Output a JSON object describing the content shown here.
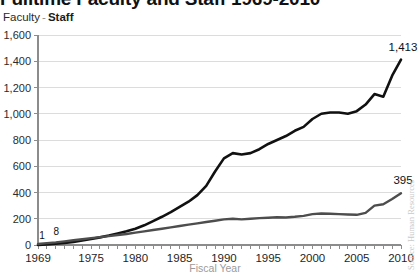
{
  "chart_title": "Fulltime Faculty and Staff   1969-2010",
  "legend": {
    "series_a": "Faculty",
    "separator": "-",
    "series_b": "Staff"
  },
  "axis_title_x": "Fiscal Year",
  "source_note": "Source: Human Resources",
  "colors": {
    "faculty_line": "#111111",
    "staff_line": "#4d4d4d",
    "gridline": "#dcdcdc",
    "axis": "#8c8c8c",
    "axis_label": "#1f1f1f",
    "axis_title": "#9b9b9b",
    "background": "#ffffff"
  },
  "annotations": {
    "start_faculty": "1",
    "start_staff": "8",
    "end_faculty": "1,413",
    "end_staff": "395"
  },
  "chart_data": {
    "type": "line",
    "title": "Fulltime Faculty and Staff   1969-2010",
    "xlabel": "Fiscal Year",
    "ylabel": "",
    "xlim": [
      1969,
      2010
    ],
    "ylim": [
      0,
      1600
    ],
    "grid": true,
    "legend_position": "top-left",
    "yticks": [
      0,
      200,
      400,
      600,
      800,
      1000,
      1200,
      1400,
      1600
    ],
    "ytick_labels": [
      "0",
      "200",
      "400",
      "600",
      "800",
      "1,000",
      "1,200",
      "1,400",
      "1,600"
    ],
    "xticks": [
      1969,
      1975,
      1980,
      1985,
      1990,
      1995,
      2000,
      2005,
      2010
    ],
    "xtick_labels": [
      "1969",
      "1975",
      "1980",
      "1985",
      "1990",
      "1995",
      "2000",
      "2005",
      "2010"
    ],
    "x": [
      1969,
      1970,
      1971,
      1972,
      1973,
      1974,
      1975,
      1976,
      1977,
      1978,
      1979,
      1980,
      1981,
      1982,
      1983,
      1984,
      1985,
      1986,
      1987,
      1988,
      1989,
      1990,
      1991,
      1992,
      1993,
      1994,
      1995,
      1996,
      1997,
      1998,
      1999,
      2000,
      2001,
      2002,
      2003,
      2004,
      2005,
      2006,
      2007,
      2008,
      2009,
      2010
    ],
    "series": [
      {
        "name": "Faculty",
        "color": "#111111",
        "start_label": "1",
        "end_label": "1,413",
        "values": [
          1,
          5,
          10,
          16,
          24,
          34,
          46,
          58,
          72,
          88,
          104,
          124,
          150,
          182,
          215,
          250,
          290,
          330,
          380,
          450,
          560,
          660,
          700,
          690,
          700,
          730,
          770,
          800,
          830,
          870,
          900,
          960,
          1000,
          1010,
          1010,
          1000,
          1020,
          1070,
          1150,
          1130,
          1290,
          1413
        ]
      },
      {
        "name": "Staff",
        "color": "#4d4d4d",
        "start_label": "8",
        "end_label": "395",
        "values": [
          8,
          14,
          20,
          28,
          36,
          44,
          52,
          60,
          68,
          76,
          84,
          94,
          104,
          114,
          124,
          134,
          145,
          155,
          165,
          175,
          185,
          195,
          200,
          195,
          200,
          205,
          208,
          212,
          210,
          215,
          222,
          235,
          240,
          238,
          235,
          232,
          230,
          245,
          300,
          310,
          350,
          395
        ]
      }
    ]
  }
}
